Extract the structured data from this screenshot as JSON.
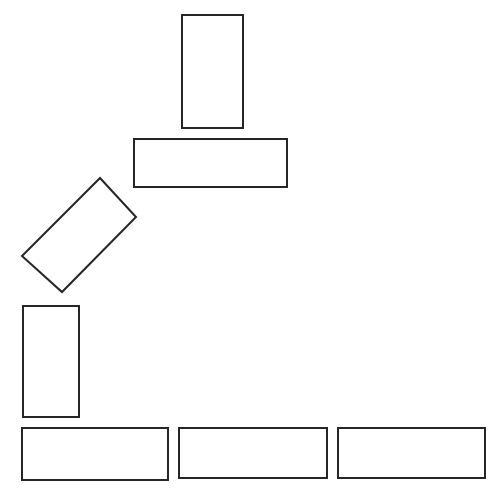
{
  "figure": {
    "background_color": "#ffffff",
    "stroke_color": "#262626",
    "fill_color": "#ffffff",
    "stroke_width": 2,
    "width": 498,
    "height": 502,
    "shape_count": 7
  },
  "chart_data": {
    "type": "diagram",
    "units": "pixels",
    "xlim": [
      0,
      498
    ],
    "ylim": [
      0,
      502
    ],
    "grid": false,
    "legend": null,
    "shapes": [
      {
        "id": "rect-top-vertical",
        "label": "Top vertical rectangle",
        "kind": "rectangle",
        "x": 182,
        "y": 15,
        "width": 61,
        "height": 113,
        "rotation_deg": 0,
        "center": [
          212.5,
          71.5
        ],
        "corners": [
          [
            182,
            15
          ],
          [
            243,
            15
          ],
          [
            243,
            128
          ],
          [
            182,
            128
          ]
        ]
      },
      {
        "id": "rect-upper-horizontal",
        "label": "Upper horizontal rectangle",
        "kind": "rectangle",
        "x": 134,
        "y": 139,
        "width": 153,
        "height": 48,
        "rotation_deg": 0,
        "center": [
          210.5,
          163
        ],
        "corners": [
          [
            134,
            139
          ],
          [
            287,
            139
          ],
          [
            287,
            187
          ],
          [
            134,
            187
          ]
        ]
      },
      {
        "id": "rect-rotated-diagonal",
        "label": "Rotated diagonal rectangle",
        "kind": "rectangle",
        "x": 22,
        "y": 178,
        "width": 53,
        "height": 114,
        "rotation_deg": -47,
        "center": [
          79,
          235
        ],
        "corners": [
          [
            100,
            178
          ],
          [
            136,
            217
          ],
          [
            62,
            292
          ],
          [
            22,
            256
          ]
        ]
      },
      {
        "id": "rect-left-vertical",
        "label": "Left vertical rectangle",
        "kind": "rectangle",
        "x": 23,
        "y": 306,
        "width": 56,
        "height": 111,
        "rotation_deg": 0,
        "center": [
          51,
          361.5
        ],
        "corners": [
          [
            23,
            306
          ],
          [
            79,
            306
          ],
          [
            79,
            417
          ],
          [
            23,
            417
          ]
        ]
      },
      {
        "id": "rect-bottom-left",
        "label": "Bottom-left horizontal rectangle",
        "kind": "rectangle",
        "x": 22,
        "y": 428,
        "width": 146,
        "height": 52,
        "rotation_deg": 0,
        "center": [
          95,
          454
        ],
        "corners": [
          [
            22,
            428
          ],
          [
            168,
            428
          ],
          [
            168,
            480
          ],
          [
            22,
            480
          ]
        ]
      },
      {
        "id": "rect-bottom-center",
        "label": "Bottom-center horizontal rectangle",
        "kind": "rectangle",
        "x": 179,
        "y": 428,
        "width": 148,
        "height": 50,
        "rotation_deg": 0,
        "center": [
          253,
          453
        ],
        "corners": [
          [
            179,
            428
          ],
          [
            327,
            428
          ],
          [
            327,
            478
          ],
          [
            179,
            478
          ]
        ]
      },
      {
        "id": "rect-bottom-right",
        "label": "Bottom-right horizontal rectangle",
        "kind": "rectangle",
        "x": 338,
        "y": 428,
        "width": 147,
        "height": 50,
        "rotation_deg": 0,
        "center": [
          411.5,
          453
        ],
        "corners": [
          [
            338,
            428
          ],
          [
            485,
            428
          ],
          [
            485,
            478
          ],
          [
            338,
            478
          ]
        ]
      }
    ]
  }
}
